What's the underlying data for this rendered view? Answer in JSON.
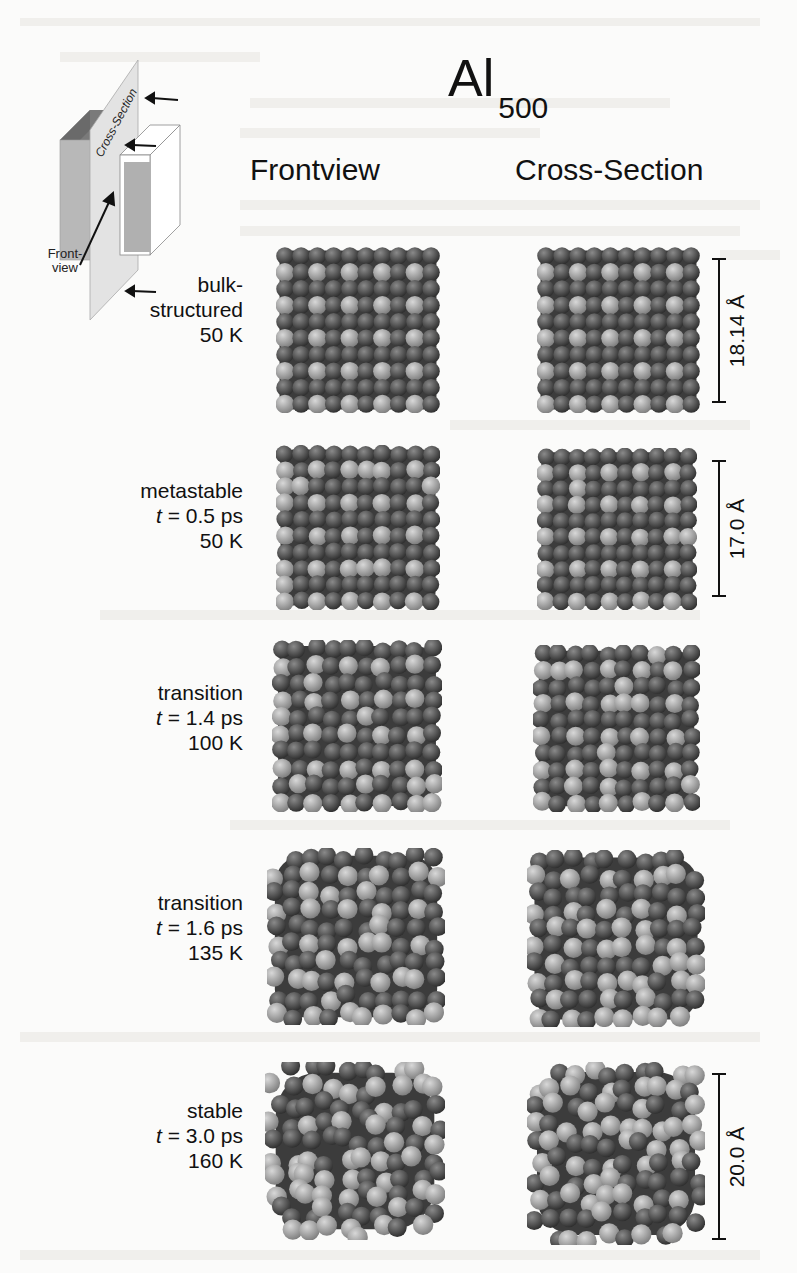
{
  "figure": {
    "title": {
      "main": "Al",
      "subscript": "500"
    },
    "column_headers": [
      "Frontview",
      "Cross-Section"
    ],
    "schematic": {
      "plane_label": "Cross-Section",
      "front_label_line1": "Front-",
      "front_label_line2": "view",
      "arrows": 4
    },
    "rows": [
      {
        "state": "bulk-",
        "state2": "structured",
        "time_prefix": "",
        "time": "",
        "temperature": "50 K",
        "scale_label": "18.14 Å",
        "disorder": 0.0,
        "has_scale": true
      },
      {
        "state": "metastable",
        "state2": "",
        "time_prefix": "t",
        "time": " = 0.5 ps",
        "temperature": "50 K",
        "scale_label": "17.0 Å",
        "disorder": 0.12,
        "has_scale": true
      },
      {
        "state": "transition",
        "state2": "",
        "time_prefix": "t",
        "time": " = 1.4 ps",
        "temperature": "100 K",
        "scale_label": "",
        "disorder": 0.3,
        "has_scale": false
      },
      {
        "state": "transition",
        "state2": "",
        "time_prefix": "t",
        "time": " = 1.6 ps",
        "temperature": "135 K",
        "scale_label": "",
        "disorder": 0.5,
        "has_scale": false
      },
      {
        "state": "stable",
        "state2": "",
        "time_prefix": "t",
        "time": " = 3.0 ps",
        "temperature": "160 K",
        "scale_label": "20.0 Å",
        "disorder": 0.85,
        "has_scale": true
      }
    ],
    "colors": {
      "atom_dark": "#4a4a4a",
      "atom_light": "#9a9a9a",
      "text": "#111111",
      "background": "#fbfbfa"
    }
  }
}
